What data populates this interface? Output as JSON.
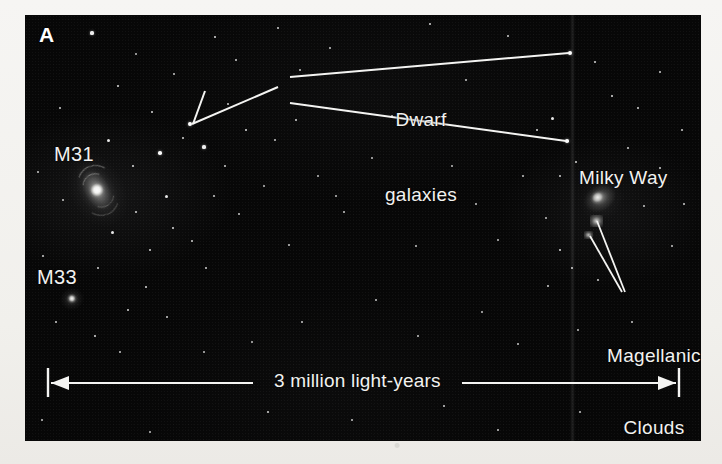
{
  "figure": {
    "panel_letter": "A",
    "panel_bg_color": "#070707",
    "page_bg_color": "#f3f2ef",
    "ink_color": "#f2f2f0"
  },
  "labels": {
    "m31": "M31",
    "m33": "M33",
    "milky_way": "Milky Way",
    "dwarf_galaxies_line1": "Dwarf",
    "dwarf_galaxies_line2": "galaxies",
    "magellanic_line1": "Magellanic",
    "magellanic_line2": "Clouds"
  },
  "scale_bar": {
    "text": "3 million light-years",
    "value": 3,
    "unit": "million light-years",
    "left_x": 48,
    "right_x": 679,
    "y": 383
  },
  "objects": [
    {
      "name": "M31",
      "type": "spiral-galaxy",
      "x": 97,
      "y": 188
    },
    {
      "name": "M33",
      "type": "spiral-galaxy",
      "x": 72,
      "y": 300
    },
    {
      "name": "Milky Way",
      "type": "spiral-galaxy",
      "x": 600,
      "y": 198
    },
    {
      "name": "Large Magellanic Cloud",
      "type": "irregular-galaxy",
      "x": 597,
      "y": 221
    },
    {
      "name": "Small Magellanic Cloud",
      "type": "irregular-galaxy",
      "x": 589,
      "y": 236
    }
  ],
  "leader_targets": [
    {
      "label": "Dwarf galaxies",
      "target_x": 193,
      "target_y": 124
    },
    {
      "label": "Dwarf galaxies",
      "target_x": 570,
      "target_y": 53
    },
    {
      "label": "Dwarf galaxies",
      "target_x": 567,
      "target_y": 141
    },
    {
      "label": "Magellanic Clouds",
      "target_x": 597,
      "target_y": 221
    },
    {
      "label": "Magellanic Clouds",
      "target_x": 589,
      "target_y": 236
    }
  ],
  "stars": [
    [
      92,
      33,
      1.6
    ],
    [
      215,
      37,
      1.4
    ],
    [
      278,
      28,
      1.2
    ],
    [
      430,
      24,
      1.3
    ],
    [
      508,
      36,
      1.2
    ],
    [
      118,
      86,
      1.4
    ],
    [
      152,
      112,
      1.3
    ],
    [
      190,
      124,
      1.9
    ],
    [
      236,
      60,
      1.2
    ],
    [
      330,
      48,
      1.1
    ],
    [
      60,
      108,
      1.2
    ],
    [
      108,
      140,
      1.5
    ],
    [
      160,
      153,
      1.8
    ],
    [
      133,
      166,
      1.4
    ],
    [
      183,
      138,
      1.3
    ],
    [
      204,
      147,
      1.6
    ],
    [
      246,
      130,
      1.4
    ],
    [
      225,
      166,
      1.2
    ],
    [
      275,
      140,
      1.1
    ],
    [
      296,
      120,
      1.3
    ],
    [
      166,
      196,
      1.5
    ],
    [
      136,
      212,
      1.3
    ],
    [
      173,
      228,
      1.4
    ],
    [
      192,
      241,
      1.2
    ],
    [
      150,
      250,
      1.3
    ],
    [
      112,
      232,
      1.5
    ],
    [
      206,
      268,
      1.2
    ],
    [
      146,
      287,
      1.4
    ],
    [
      98,
      268,
      1.2
    ],
    [
      128,
      310,
      1.3
    ],
    [
      167,
      317,
      1.2
    ],
    [
      95,
      336,
      1.4
    ],
    [
      56,
      322,
      1.2
    ],
    [
      63,
      200,
      1.1
    ],
    [
      43,
      256,
      1.2
    ],
    [
      38,
      172,
      1.1
    ],
    [
      214,
      196,
      1.2
    ],
    [
      239,
      214,
      1.1
    ],
    [
      264,
      186,
      1.0
    ],
    [
      289,
      245,
      1.1
    ],
    [
      318,
      176,
      1.0
    ],
    [
      344,
      212,
      1.1
    ],
    [
      372,
      158,
      1.0
    ],
    [
      398,
      200,
      1.0
    ],
    [
      416,
      246,
      1.1
    ],
    [
      452,
      166,
      1.0
    ],
    [
      476,
      204,
      1.1
    ],
    [
      498,
      240,
      1.0
    ],
    [
      523,
      176,
      1.1
    ],
    [
      546,
      218,
      1.0
    ],
    [
      570,
      53,
      1.9
    ],
    [
      567,
      141,
      1.8
    ],
    [
      552,
      118,
      1.5
    ],
    [
      537,
      130,
      1.3
    ],
    [
      595,
      62,
      1.3
    ],
    [
      612,
      96,
      1.4
    ],
    [
      638,
      108,
      1.3
    ],
    [
      660,
      72,
      1.2
    ],
    [
      682,
      130,
      1.2
    ],
    [
      576,
      162,
      1.3
    ],
    [
      560,
      176,
      1.2
    ],
    [
      560,
      250,
      1.4
    ],
    [
      572,
      268,
      1.3
    ],
    [
      548,
      286,
      1.2
    ],
    [
      660,
      168,
      1.2
    ],
    [
      684,
      204,
      1.2
    ],
    [
      672,
      246,
      1.1
    ],
    [
      644,
      206,
      1.1
    ],
    [
      628,
      148,
      1.2
    ],
    [
      598,
      280,
      1.2
    ],
    [
      376,
      300,
      1.1
    ],
    [
      302,
      322,
      1.1
    ],
    [
      252,
      342,
      1.0
    ],
    [
      418,
      336,
      1.1
    ],
    [
      482,
      312,
      1.0
    ],
    [
      518,
      344,
      1.1
    ],
    [
      578,
      330,
      1.0
    ],
    [
      632,
      322,
      1.1
    ],
    [
      204,
      352,
      1.0
    ],
    [
      120,
      352,
      1.1
    ],
    [
      268,
      412,
      1.3
    ],
    [
      352,
      420,
      1.1
    ],
    [
      444,
      406,
      1.2
    ],
    [
      580,
      412,
      1.1
    ],
    [
      648,
      424,
      1.2
    ],
    [
      42,
      420,
      1.1
    ],
    [
      150,
      432,
      1.0
    ],
    [
      498,
      430,
      1.1
    ],
    [
      336,
      196,
      1.0
    ],
    [
      228,
      104,
      1.1
    ],
    [
      392,
      116,
      1.0
    ],
    [
      466,
      80,
      1.1
    ],
    [
      300,
      70,
      1.0
    ],
    [
      174,
      74,
      1.1
    ],
    [
      136,
      54,
      1.0
    ]
  ]
}
